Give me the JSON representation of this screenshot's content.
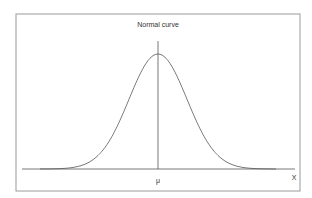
{
  "diagram": {
    "title": "Normal curve",
    "x_axis_label": "X",
    "mean_label": "μ",
    "colors": {
      "line": "#555555",
      "frame": "#9a9a9a",
      "text": "#333333",
      "background": "#ffffff"
    }
  },
  "chart_data": {
    "type": "line",
    "title": "Normal curve",
    "xlabel": "X",
    "ylabel": "",
    "series": [
      {
        "name": "Normal density",
        "distribution": "normal",
        "mean_label": "μ",
        "x_sigma": [
          -3.5,
          -3,
          -2.5,
          -2,
          -1.5,
          -1,
          -0.5,
          0,
          0.5,
          1,
          1.5,
          2,
          2.5,
          3,
          3.5
        ],
        "relative_height": [
          0.002,
          0.011,
          0.044,
          0.135,
          0.325,
          0.607,
          0.882,
          1.0,
          0.882,
          0.607,
          0.325,
          0.135,
          0.044,
          0.011,
          0.002
        ]
      }
    ],
    "annotations": [
      {
        "type": "vertical-line",
        "at": "μ",
        "label": "μ"
      }
    ],
    "tick_labels": [
      "μ"
    ],
    "grid": false,
    "legend": "none"
  }
}
